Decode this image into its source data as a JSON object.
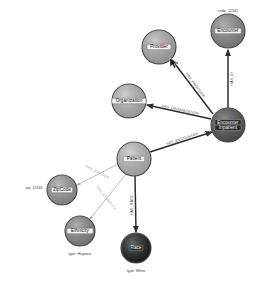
{
  "canvas": {
    "width": 263,
    "height": 283,
    "background": "#ffffff"
  },
  "graph": {
    "type": "node-link-graph",
    "title": "Healthcare knowledge graph",
    "nodes": [
      {
        "id": "encounter-id",
        "label": "Encounter",
        "x": 228,
        "y": 31,
        "r": 17,
        "fill": "#8c8c8c",
        "dark": false,
        "property": "code: 12345",
        "property_x": 228,
        "property_y": 11
      },
      {
        "id": "provider",
        "label": "Provider",
        "x": 159,
        "y": 47,
        "r": 17,
        "fill": "#b0b0b0",
        "dark": false,
        "property": "",
        "property_x": 0,
        "property_y": 0
      },
      {
        "id": "organization",
        "label": "Organization",
        "x": 129,
        "y": 101,
        "r": 17,
        "fill": "#b8b8b8",
        "dark": false,
        "property": "",
        "property_x": 0,
        "property_y": 0
      },
      {
        "id": "encounter",
        "label": "Encounter",
        "label2": "Inpatient",
        "x": 228,
        "y": 125,
        "r": 17,
        "fill": "#555555",
        "dark": true,
        "property": "",
        "property_x": 0,
        "property_y": 0
      },
      {
        "id": "patient",
        "label": "Patient",
        "x": 134,
        "y": 159,
        "r": 17,
        "fill": "#bdbdbd",
        "dark": false,
        "property": "",
        "property_x": 0,
        "property_y": 0
      },
      {
        "id": "zipcode",
        "label": "ZipCode",
        "x": 62,
        "y": 190,
        "r": 15,
        "fill": "#9a9a9a",
        "dark": false,
        "property": "zip: 12345",
        "property_x": 34,
        "property_y": 188
      },
      {
        "id": "ethnicity",
        "label": "Ethnicity",
        "x": 80,
        "y": 231,
        "r": 15,
        "fill": "#8a8a8a",
        "dark": false,
        "property": "type: Hispanic",
        "property_x": 80,
        "property_y": 254
      },
      {
        "id": "race",
        "label": "Race",
        "x": 136,
        "y": 248,
        "r": 15,
        "fill": "#1c1c1c",
        "dark": true,
        "property": "type: White",
        "property_x": 136,
        "property_y": 271
      }
    ],
    "edges": [
      {
        "id": "edge-has-id",
        "label": "HAS_ID",
        "from": "encounter",
        "to": "encounter-id",
        "x1": 228,
        "y1": 108,
        "x2": 228,
        "y2": 50,
        "label_x": 232,
        "label_y": 79,
        "rotate": -90,
        "style": "strong"
      },
      {
        "id": "edge-has-provider",
        "label": "HAS_PROVIDER",
        "from": "encounter",
        "to": "provider",
        "x1": 213,
        "y1": 114,
        "x2": 172,
        "y2": 60,
        "label_x": 195,
        "label_y": 85,
        "rotate": 53,
        "style": "strong"
      },
      {
        "id": "edge-has-organization",
        "label": "HAS_ORGANIZATION",
        "from": "encounter",
        "to": "organization",
        "x1": 211,
        "y1": 119,
        "x2": 147,
        "y2": 105,
        "label_x": 180,
        "label_y": 110,
        "rotate": 12,
        "style": "strong"
      },
      {
        "id": "edge-has-encounter",
        "label": "HAS_ENCOUNTER",
        "from": "patient",
        "to": "encounter",
        "x1": 150,
        "y1": 152,
        "x2": 212,
        "y2": 132,
        "label_x": 182,
        "label_y": 139,
        "rotate": -18,
        "style": "strong"
      },
      {
        "id": "edge-has-zipcode",
        "label": "HAS_ZIPCODE",
        "from": "patient",
        "to": "zipcode",
        "x1": 118,
        "y1": 164,
        "x2": 77,
        "y2": 185,
        "label_x": 97,
        "label_y": 172,
        "rotate": 27,
        "style": "faint"
      },
      {
        "id": "edge-has-ethnicity",
        "label": "HAS_ETHNICITY",
        "from": "patient",
        "to": "ethnicity",
        "x1": 126,
        "y1": 174,
        "x2": 90,
        "y2": 219,
        "label_x": 106,
        "label_y": 198,
        "rotate": 52,
        "style": "faint"
      },
      {
        "id": "edge-has-race",
        "label": "HAS_RACE",
        "from": "patient",
        "to": "race",
        "x1": 135,
        "y1": 176,
        "x2": 136,
        "y2": 232,
        "label_x": 132,
        "label_y": 205,
        "rotate": -90,
        "style": "strong"
      }
    ],
    "cursor": {
      "name": "mouse-pointer",
      "x": 170,
      "y": 58,
      "visible": true
    }
  }
}
